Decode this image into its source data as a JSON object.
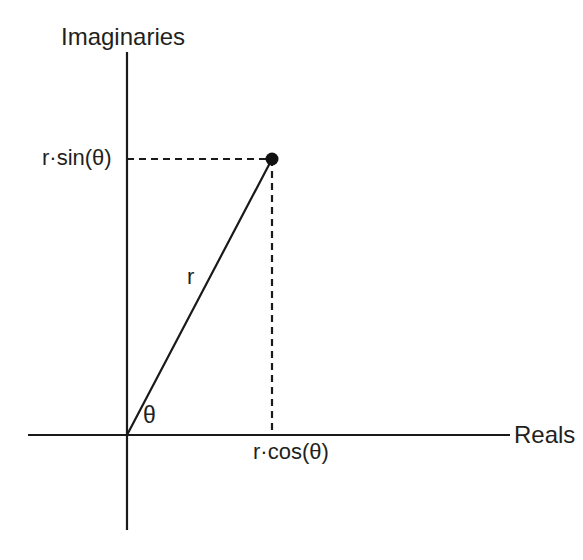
{
  "figure": {
    "background_color": "#ffffff",
    "stroke_color": "#1a1a1a",
    "text_color": "#231f20",
    "width": 583,
    "height": 560
  },
  "axes": {
    "vertical": {
      "label": "Imaginaries",
      "x": 127,
      "y_top": 52,
      "y_bottom": 530
    },
    "horizontal": {
      "label": "Reals",
      "y": 435,
      "x_left": 28,
      "x_right": 510
    },
    "origin": {
      "x": 127,
      "y": 435
    }
  },
  "point": {
    "name": "complex-number-point",
    "x": 272,
    "y": 159,
    "radius": 6.5
  },
  "segments": {
    "radius": {
      "label": "r",
      "style": "solid",
      "from": {
        "x": 127,
        "y": 435
      },
      "to": {
        "x": 272,
        "y": 159
      }
    },
    "imaginary_projection": {
      "label": "r·sin(θ)",
      "style": "dashed",
      "from": {
        "x": 127,
        "y": 159
      },
      "to": {
        "x": 272,
        "y": 159
      }
    },
    "real_projection": {
      "label": "r·cos(θ)",
      "style": "dashed",
      "from": {
        "x": 272,
        "y": 159
      },
      "to": {
        "x": 272,
        "y": 435
      }
    }
  },
  "angle": {
    "label": "θ",
    "vertex": {
      "x": 127,
      "y": 435
    }
  },
  "labels": {
    "imaginaries": "Imaginaries",
    "reals": "Reals",
    "r_sin_theta": "r·sin(θ)",
    "r_cos_theta": "r·cos(θ)",
    "r": "r",
    "theta": "θ"
  }
}
